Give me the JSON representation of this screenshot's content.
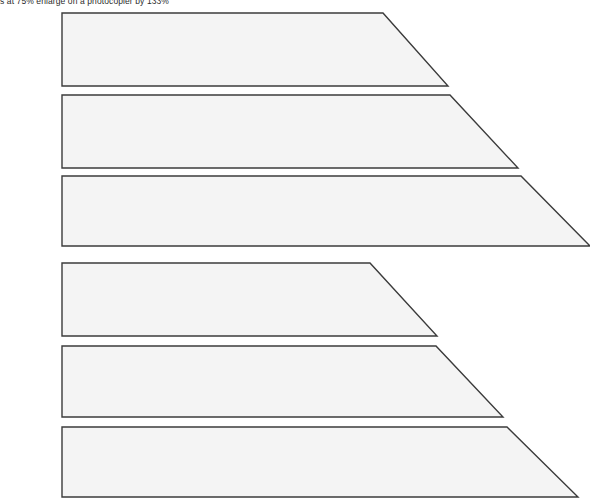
{
  "page": {
    "width": 590,
    "height": 501,
    "background_color": "#ffffff"
  },
  "header": {
    "note": "s at 75%  enlarge on a photocopier by 133%",
    "clipped": "top"
  },
  "style": {
    "shape_fill": "#f4f4f4",
    "shape_stroke": "#3b3b3b",
    "stroke_width": 1.4,
    "text_color": "#2b2b2b"
  },
  "shapes": {
    "type": "right-trapezoid",
    "description": "Six stacked right trapezoids with a common left edge; horizontal top edge then a diagonal slanting down to the right to a bottom-right tip.",
    "common_left_x": 62,
    "items": [
      {
        "id": "trapezoid-1",
        "group": 1,
        "index_in_group": 1,
        "left_x": 62,
        "top_y": 13,
        "bottom_y": 86,
        "top_right_x": 383,
        "bottom_right_x": 448,
        "points": "62,13 383,13 448,86 62,86"
      },
      {
        "id": "trapezoid-2",
        "group": 1,
        "index_in_group": 2,
        "left_x": 62,
        "top_y": 95,
        "bottom_y": 168,
        "top_right_x": 450,
        "bottom_right_x": 518,
        "points": "62,95 450,95 518,168 62,168"
      },
      {
        "id": "trapezoid-3",
        "group": 1,
        "index_in_group": 3,
        "left_x": 62,
        "top_y": 176,
        "bottom_y": 246,
        "top_right_x": 521,
        "bottom_right_x": 590,
        "points": "62,176 521,176 590,246 62,246"
      },
      {
        "id": "trapezoid-4",
        "group": 2,
        "index_in_group": 1,
        "left_x": 62,
        "top_y": 263,
        "bottom_y": 336,
        "top_right_x": 370,
        "bottom_right_x": 437,
        "points": "62,263 370,263 437,336 62,336"
      },
      {
        "id": "trapezoid-5",
        "group": 2,
        "index_in_group": 2,
        "left_x": 62,
        "top_y": 346,
        "bottom_y": 417,
        "top_right_x": 436,
        "bottom_right_x": 503,
        "points": "62,346 436,346 503,417 62,417"
      },
      {
        "id": "trapezoid-6",
        "group": 2,
        "index_in_group": 3,
        "left_x": 62,
        "top_y": 427,
        "bottom_y": 497,
        "top_right_x": 507,
        "bottom_right_x": 578,
        "points": "62,427 507,427 578,497 62,497"
      }
    ]
  }
}
